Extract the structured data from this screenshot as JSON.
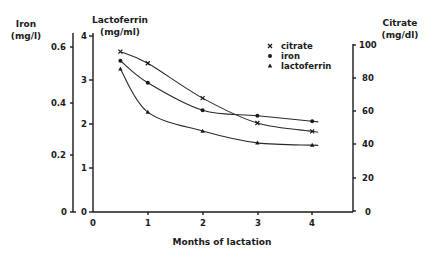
{
  "chart_data": {
    "type": "line",
    "title": "",
    "xlabel": "Months of lactation",
    "x_ticks": [
      "0",
      "1",
      "2",
      "3",
      "4"
    ],
    "xlim": [
      0,
      4.7
    ],
    "grid": false,
    "legend_position": "upper right (inside plot)",
    "axes": {
      "iron": {
        "label_line1": "Iron",
        "label_line2": "(mg/l)",
        "side": "left-outer",
        "ylim": [
          0,
          0.6
        ],
        "ticks": [
          "0",
          "0.2",
          "0.4",
          "0.6"
        ]
      },
      "lactoferrin": {
        "label_line1": "Lactoferrin",
        "label_line2": "(mg/ml)",
        "side": "left-inner",
        "ylim": [
          0,
          4
        ],
        "ticks": [
          "0",
          "1",
          "2",
          "3",
          "4"
        ]
      },
      "citrate": {
        "label_line1": "Citrate",
        "label_line2": "(mg/dl)",
        "side": "right",
        "ylim": [
          0,
          100
        ],
        "ticks": [
          "0",
          "20",
          "40",
          "60",
          "80",
          "100"
        ]
      }
    },
    "x": [
      0.5,
      1,
      2,
      3,
      4
    ],
    "series": [
      {
        "name": "citrate",
        "marker": "x",
        "axis": "citrate",
        "values": [
          96,
          89,
          68,
          53,
          48
        ]
      },
      {
        "name": "iron",
        "marker": "dot",
        "axis": "iron",
        "values": [
          0.55,
          0.47,
          0.37,
          0.35,
          0.33
        ]
      },
      {
        "name": "lactoferrin",
        "marker": "triangle",
        "axis": "lactoferrin",
        "values": [
          3.25,
          2.27,
          1.84,
          1.57,
          1.52
        ]
      }
    ]
  },
  "legend": [
    {
      "label": "citrate",
      "marker": "x"
    },
    {
      "label": "iron",
      "marker": "dot"
    },
    {
      "label": "lactoferrin",
      "marker": "triangle"
    }
  ]
}
